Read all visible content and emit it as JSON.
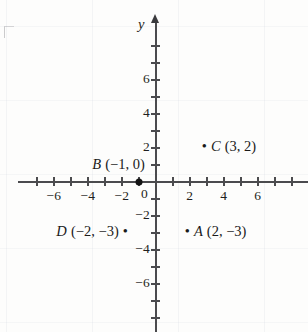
{
  "figure": {
    "type": "coordinate-plane",
    "x_axis_name": "x",
    "y_axis_name": "y"
  },
  "chart_data": {
    "type": "scatter",
    "title": "",
    "xlabel": "",
    "ylabel": "y",
    "xlim": [
      -8,
      8
    ],
    "ylim": [
      -8,
      8
    ],
    "grid": false,
    "x_ticks_labeled": [
      "-6",
      "-4",
      "-2",
      "0",
      "2",
      "4",
      "6"
    ],
    "y_ticks_labeled": [
      "6",
      "4",
      "2",
      "0",
      "-2",
      "-4",
      "-6"
    ],
    "origin_label": "0",
    "points": [
      {
        "name": "A",
        "x": 2,
        "y": -3,
        "label": "A (2, −3)",
        "dot_side": "left"
      },
      {
        "name": "B",
        "x": -1,
        "y": 0,
        "label": "B (−1, 0)",
        "dot_side": "none"
      },
      {
        "name": "C",
        "x": 3,
        "y": 2,
        "label": "C (3, 2)",
        "dot_side": "left"
      },
      {
        "name": "D",
        "x": -2,
        "y": -3,
        "label": "D (−2, −3)",
        "dot_side": "right"
      }
    ]
  },
  "ticks": {
    "x": [
      {
        "value": -7,
        "label": ""
      },
      {
        "value": -6,
        "label": "−6"
      },
      {
        "value": -5,
        "label": ""
      },
      {
        "value": -4,
        "label": "−4"
      },
      {
        "value": -3,
        "label": ""
      },
      {
        "value": -2,
        "label": "−2"
      },
      {
        "value": -1,
        "label": ""
      },
      {
        "value": 1,
        "label": ""
      },
      {
        "value": 2,
        "label": "2"
      },
      {
        "value": 3,
        "label": ""
      },
      {
        "value": 4,
        "label": "4"
      },
      {
        "value": 5,
        "label": ""
      },
      {
        "value": 6,
        "label": "6"
      },
      {
        "value": 7,
        "label": ""
      },
      {
        "value": 8,
        "label": ""
      }
    ],
    "y": [
      {
        "value": 8,
        "label": ""
      },
      {
        "value": 7,
        "label": ""
      },
      {
        "value": 6,
        "label": "6"
      },
      {
        "value": 5,
        "label": ""
      },
      {
        "value": 4,
        "label": "4"
      },
      {
        "value": 3,
        "label": ""
      },
      {
        "value": 2,
        "label": "2"
      },
      {
        "value": 1,
        "label": ""
      },
      {
        "value": -1,
        "label": ""
      },
      {
        "value": -2,
        "label": "−2"
      },
      {
        "value": -3,
        "label": ""
      },
      {
        "value": -4,
        "label": "−4"
      },
      {
        "value": -5,
        "label": ""
      },
      {
        "value": -6,
        "label": "−6"
      },
      {
        "value": -7,
        "label": ""
      },
      {
        "value": -8,
        "label": ""
      }
    ]
  },
  "colors": {
    "axis": "#4b4b4e",
    "point": "#141414",
    "text": "#1a1a1a",
    "background": "#fdfdfc"
  }
}
